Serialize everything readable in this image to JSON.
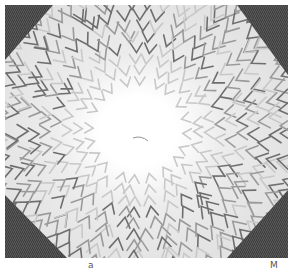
{
  "image": {
    "description": "Hand-drawn radial pattern of grey chevron (V) marks surrounding a bright white center, with dark textured corners",
    "colors": {
      "background": "#f2f2f2",
      "center": "#ffffff",
      "chevron_dark": "#6e6e6e",
      "chevron_mid": "#9a9a9a",
      "chevron_light": "#c8c8c8",
      "corner_dark": "#3a3a3a"
    }
  },
  "caption": {
    "left_fragment": "a",
    "right_fragment": "M"
  }
}
